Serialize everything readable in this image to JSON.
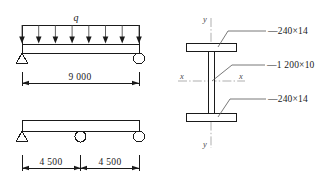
{
  "figure": {
    "left_panel": {
      "top_diagram": {
        "name": "uniformly-loaded-simply-supported-beam",
        "load_label": "q",
        "load_arrow_count": 8,
        "left_support_type": "pin",
        "right_support_type": "roller",
        "dimension_label": "9 000"
      },
      "bottom_diagram": {
        "name": "two-span-beam",
        "supports": [
          "pin",
          "roller",
          "roller"
        ],
        "dimension_labels": [
          "4 500",
          "4 500"
        ]
      }
    },
    "right_panel": {
      "name": "welded-I-section",
      "axis_labels": {
        "y_top": "y",
        "y_bottom": "y",
        "x_left": "x",
        "x_right": "x"
      },
      "callouts": [
        {
          "id": "top-flange",
          "text": "—240×14"
        },
        {
          "id": "web",
          "text": "—1 200×10"
        },
        {
          "id": "bottom-flange",
          "text": "—240×14"
        }
      ]
    }
  },
  "colors": {
    "line": "#1a1a1a",
    "thin_line": "#3a3a3a",
    "leader": "#555555",
    "axis": "#8c8c8c",
    "background": "#ffffff"
  }
}
